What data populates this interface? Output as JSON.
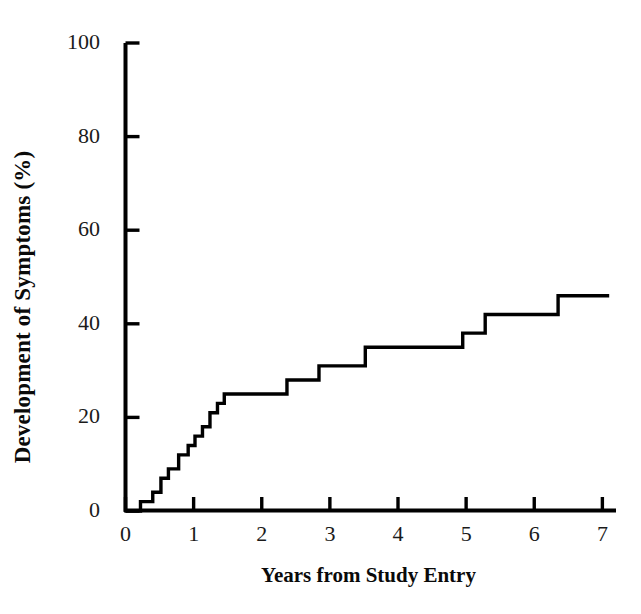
{
  "chart_data": {
    "type": "line",
    "subtype": "step",
    "title": "",
    "xlabel": "Years from Study Entry",
    "ylabel": "Development of Symptoms (%)",
    "xlim": [
      0,
      7.2
    ],
    "ylim": [
      0,
      100
    ],
    "xticks": [
      0,
      1,
      2,
      3,
      4,
      5,
      6,
      7
    ],
    "xtick_labels": [
      "0",
      "1",
      "2",
      "3",
      "4",
      "5",
      "6",
      "7"
    ],
    "yticks": [
      0,
      20,
      40,
      60,
      80,
      100
    ],
    "ytick_labels": [
      "0",
      "20",
      "40",
      "60",
      "80",
      "100"
    ],
    "grid": false,
    "legend": null,
    "line_color": "#000000",
    "line_width": 3.4,
    "series": [
      {
        "name": "Cumulative development of symptoms",
        "step_type": "post",
        "x": [
          0.0,
          0.22,
          0.22,
          0.4,
          0.4,
          0.52,
          0.52,
          0.63,
          0.63,
          0.78,
          0.78,
          0.92,
          0.92,
          1.02,
          1.02,
          1.13,
          1.13,
          1.24,
          1.24,
          1.35,
          1.35,
          1.45,
          1.45,
          2.37,
          2.37,
          2.84,
          2.84,
          3.52,
          3.52,
          4.95,
          4.95,
          5.28,
          5.28,
          6.35,
          6.35,
          7.1
        ],
        "y": [
          0,
          0,
          2,
          2,
          4,
          4,
          7,
          7,
          9,
          9,
          12,
          12,
          14,
          14,
          16,
          16,
          18,
          18,
          21,
          21,
          23,
          23,
          25,
          25,
          28,
          28,
          31,
          31,
          35,
          35,
          38,
          38,
          42,
          42,
          46,
          46
        ]
      }
    ],
    "step_events": [
      {
        "x": 0.22,
        "y": 2
      },
      {
        "x": 0.4,
        "y": 4
      },
      {
        "x": 0.52,
        "y": 7
      },
      {
        "x": 0.63,
        "y": 9
      },
      {
        "x": 0.78,
        "y": 12
      },
      {
        "x": 0.92,
        "y": 14
      },
      {
        "x": 1.02,
        "y": 16
      },
      {
        "x": 1.13,
        "y": 18
      },
      {
        "x": 1.24,
        "y": 21
      },
      {
        "x": 1.35,
        "y": 23
      },
      {
        "x": 1.45,
        "y": 25
      },
      {
        "x": 2.37,
        "y": 28
      },
      {
        "x": 2.84,
        "y": 31
      },
      {
        "x": 3.52,
        "y": 35
      },
      {
        "x": 4.95,
        "y": 38
      },
      {
        "x": 5.28,
        "y": 42
      },
      {
        "x": 6.35,
        "y": 46
      }
    ]
  }
}
